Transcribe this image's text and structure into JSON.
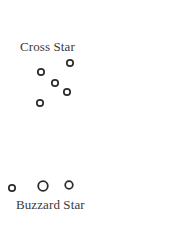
{
  "diagram": {
    "colors": {
      "background": "#ffffff",
      "star_stroke": "#2b2b2b",
      "label_text": "#3a3a3a"
    },
    "groups": [
      {
        "name": "Cross Star",
        "label": "Cross Star",
        "stars": [
          {
            "id": "cross-star-1",
            "size": "small"
          },
          {
            "id": "cross-star-2",
            "size": "small"
          },
          {
            "id": "cross-star-3",
            "size": "small"
          },
          {
            "id": "cross-star-4",
            "size": "small"
          },
          {
            "id": "cross-star-5",
            "size": "small"
          }
        ]
      },
      {
        "name": "Buzzard Star",
        "label": "Buzzard Star",
        "stars": [
          {
            "id": "buzzard-star-1",
            "size": "small"
          },
          {
            "id": "buzzard-star-2",
            "size": "large"
          },
          {
            "id": "buzzard-star-3",
            "size": "medium"
          }
        ]
      }
    ]
  }
}
